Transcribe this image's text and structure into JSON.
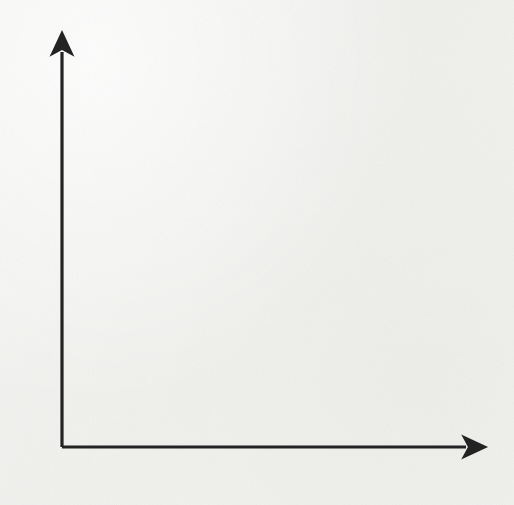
{
  "page": {
    "background_color": "#f1f1ef",
    "bleed_through_text": "Plot the points on the coordinate",
    "ink_color": "#232323",
    "grid_color": "#9a9a98"
  },
  "chart_data": {
    "type": "scatter",
    "title": "",
    "xlabel": "x",
    "ylabel": "y",
    "xlim": [
      0,
      10
    ],
    "ylim": [
      0,
      10
    ],
    "xticks": [
      0,
      1,
      2,
      3,
      4,
      5,
      6,
      7,
      8,
      9,
      10
    ],
    "yticks": [
      0,
      1,
      2,
      3,
      4,
      5,
      6,
      7,
      8,
      9,
      10
    ],
    "xtick_labels": [
      "0",
      "1",
      "2",
      "3",
      "4",
      "5",
      "6",
      "7",
      "8",
      "9",
      "10"
    ],
    "ytick_labels": [
      "0",
      "1",
      "2",
      "3",
      "4",
      "5",
      "6",
      "7",
      "8",
      "9",
      "10"
    ],
    "grid": true,
    "grid_style": "solid-thin",
    "legend": false,
    "legend_position": "none",
    "marker": "filled-circle",
    "marker_color": "#2b2b2b",
    "marker_size": 13,
    "axis_arrows": true,
    "points": [
      {
        "x": 0,
        "y": 6,
        "label": "(0, 6)"
      },
      {
        "x": 1,
        "y": 2,
        "label": "(1, 2)"
      },
      {
        "x": 3,
        "y": 4,
        "label": "(3, 4)"
      },
      {
        "x": 4,
        "y": 9,
        "label": "(4, 9)"
      },
      {
        "x": 6,
        "y": 5,
        "label": "(6, 5)"
      },
      {
        "x": 8,
        "y": 8,
        "label": "(8, 8)"
      },
      {
        "x": 9,
        "y": 1,
        "label": "(9, 1)"
      }
    ]
  },
  "geometry": {
    "origin_x": 62,
    "origin_y": 447,
    "step_x": 37,
    "step_y": 36.7,
    "x_axis_arrow_tip": 472,
    "y_axis_arrow_tip": 46
  }
}
